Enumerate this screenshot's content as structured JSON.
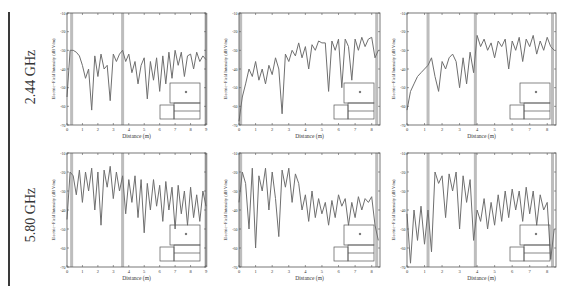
{
  "figure": {
    "rows": [
      {
        "label": "2.44 GHz"
      },
      {
        "label": "5.80 GHz"
      }
    ],
    "colors": {
      "trace": "#6f6f6f",
      "axes": "#555555",
      "marker_band": "#bdbdbd",
      "divider": "#3a3a3a"
    }
  },
  "chart_data": [
    {
      "type": "line",
      "row": "2.44 GHz",
      "col": 1,
      "xlabel": "Distance (m)",
      "ylabel": "Electric−Field Intensity (dB V/m)",
      "xlim": [
        0,
        9
      ],
      "ylim": [
        -70,
        -10
      ],
      "xticks": [
        0,
        1,
        2,
        3,
        4,
        5,
        6,
        7,
        8,
        9
      ],
      "yticks": [
        -10,
        -20,
        -30,
        -40,
        -50,
        -60,
        -70
      ],
      "markers_x": [
        0.3,
        3.6,
        9.0
      ],
      "x": [
        0,
        0.2,
        0.4,
        0.6,
        0.8,
        1.0,
        1.2,
        1.4,
        1.6,
        1.8,
        2.0,
        2.2,
        2.4,
        2.6,
        2.8,
        3.0,
        3.2,
        3.4,
        3.6,
        3.8,
        4.0,
        4.2,
        4.4,
        4.6,
        4.8,
        5.0,
        5.2,
        5.4,
        5.6,
        5.8,
        6.0,
        6.2,
        6.4,
        6.6,
        6.8,
        7.0,
        7.2,
        7.4,
        7.6,
        7.8,
        8.0,
        8.2,
        8.4,
        8.6,
        8.8,
        9.0
      ],
      "y": [
        -55,
        -30,
        -30,
        -31,
        -33,
        -38,
        -45,
        -40,
        -62,
        -33,
        -44,
        -32,
        -40,
        -38,
        -57,
        -32,
        -36,
        -32,
        -30,
        -36,
        -32,
        -42,
        -36,
        -48,
        -38,
        -34,
        -56,
        -36,
        -46,
        -34,
        -52,
        -33,
        -48,
        -31,
        -45,
        -30,
        -38,
        -31,
        -44,
        -33,
        -32,
        -40,
        -31,
        -36,
        -33,
        -35
      ]
    },
    {
      "type": "line",
      "row": "2.44 GHz",
      "col": 2,
      "xlabel": "Distance (m)",
      "ylabel": "Electric−Field Intensity (dB V/m)",
      "xlim": [
        0,
        8.5
      ],
      "ylim": [
        -70,
        -10
      ],
      "xticks": [
        0,
        1,
        2,
        3,
        4,
        5,
        6,
        7,
        8
      ],
      "yticks": [
        -10,
        -20,
        -30,
        -40,
        -50,
        -60,
        -70
      ],
      "markers_x": [
        0.1,
        8.3
      ],
      "x": [
        0,
        0.2,
        0.4,
        0.6,
        0.8,
        1.0,
        1.2,
        1.4,
        1.6,
        1.8,
        2.0,
        2.2,
        2.4,
        2.6,
        2.8,
        3.0,
        3.2,
        3.4,
        3.6,
        3.8,
        4.0,
        4.2,
        4.4,
        4.6,
        4.8,
        5.0,
        5.2,
        5.4,
        5.6,
        5.8,
        6.0,
        6.2,
        6.4,
        6.6,
        6.8,
        7.0,
        7.2,
        7.4,
        7.6,
        7.8,
        8.0,
        8.2,
        8.4
      ],
      "y": [
        -68,
        -55,
        -48,
        -40,
        -44,
        -36,
        -46,
        -40,
        -48,
        -38,
        -43,
        -34,
        -40,
        -64,
        -32,
        -36,
        -30,
        -33,
        -26,
        -34,
        -28,
        -40,
        -27,
        -30,
        -25,
        -26,
        -26,
        -52,
        -25,
        -30,
        -24,
        -50,
        -24,
        -28,
        -46,
        -24,
        -30,
        -23,
        -28,
        -24,
        -23,
        -34,
        -30
      ]
    },
    {
      "type": "line",
      "row": "2.44 GHz",
      "col": 3,
      "xlabel": "Distance (m)",
      "ylabel": "Electric−Field Intensity (dB V/m)",
      "xlim": [
        0,
        8.5
      ],
      "ylim": [
        -70,
        -10
      ],
      "xticks": [
        0,
        1,
        2,
        3,
        4,
        5,
        6,
        7,
        8
      ],
      "yticks": [
        -10,
        -20,
        -30,
        -40,
        -50,
        -60,
        -70
      ],
      "markers_x": [
        1.2,
        3.9,
        8.3
      ],
      "x": [
        0,
        0.2,
        0.4,
        0.6,
        0.8,
        1.0,
        1.2,
        1.4,
        1.6,
        1.8,
        2.0,
        2.2,
        2.4,
        2.6,
        2.8,
        3.0,
        3.2,
        3.4,
        3.6,
        3.8,
        4.0,
        4.2,
        4.4,
        4.6,
        4.8,
        5.0,
        5.2,
        5.4,
        5.6,
        5.8,
        6.0,
        6.2,
        6.4,
        6.6,
        6.8,
        7.0,
        7.2,
        7.4,
        7.6,
        7.8,
        8.0,
        8.2,
        8.4
      ],
      "y": [
        -62,
        -52,
        -48,
        -44,
        -42,
        -40,
        -38,
        -34,
        -44,
        -52,
        -36,
        -40,
        -34,
        -32,
        -36,
        -50,
        -34,
        -48,
        -31,
        -42,
        -22,
        -28,
        -24,
        -30,
        -26,
        -34,
        -25,
        -28,
        -24,
        -40,
        -25,
        -30,
        -23,
        -36,
        -24,
        -28,
        -22,
        -32,
        -25,
        -30,
        -23,
        -28,
        -30
      ]
    },
    {
      "type": "line",
      "row": "5.80 GHz",
      "col": 1,
      "xlabel": "Distance (m)",
      "ylabel": "Electric−Field Intensity (dB V/m)",
      "xlim": [
        0,
        9
      ],
      "ylim": [
        -70,
        -10
      ],
      "xticks": [
        0,
        1,
        2,
        3,
        4,
        5,
        6,
        7,
        8,
        9
      ],
      "yticks": [
        -10,
        -20,
        -30,
        -40,
        -50,
        -60,
        -70
      ],
      "markers_x": [
        0.3,
        3.6,
        9.0
      ],
      "x": [
        0,
        0.2,
        0.4,
        0.6,
        0.8,
        1.0,
        1.2,
        1.4,
        1.6,
        1.8,
        2.0,
        2.2,
        2.4,
        2.6,
        2.8,
        3.0,
        3.2,
        3.4,
        3.6,
        3.8,
        4.0,
        4.2,
        4.4,
        4.6,
        4.8,
        5.0,
        5.2,
        5.4,
        5.6,
        5.8,
        6.0,
        6.2,
        6.4,
        6.6,
        6.8,
        7.0,
        7.2,
        7.4,
        7.6,
        7.8,
        8.0,
        8.2,
        8.4,
        8.6,
        8.8,
        9.0
      ],
      "y": [
        -45,
        -20,
        -22,
        -32,
        -19,
        -36,
        -20,
        -30,
        -18,
        -40,
        -20,
        -48,
        -19,
        -28,
        -17,
        -34,
        -20,
        -30,
        -22,
        -42,
        -24,
        -36,
        -22,
        -44,
        -24,
        -52,
        -26,
        -40,
        -24,
        -38,
        -27,
        -46,
        -25,
        -40,
        -28,
        -50,
        -27,
        -42,
        -30,
        -48,
        -28,
        -44,
        -32,
        -46,
        -30,
        -38
      ]
    },
    {
      "type": "line",
      "row": "5.80 GHz",
      "col": 2,
      "xlabel": "Distance (m)",
      "ylabel": "Electric−Field Intensity (dB V/m)",
      "xlim": [
        0,
        8.5
      ],
      "ylim": [
        -70,
        -10
      ],
      "xticks": [
        0,
        1,
        2,
        3,
        4,
        5,
        6,
        7,
        8
      ],
      "yticks": [
        -10,
        -20,
        -30,
        -40,
        -50,
        -60,
        -70
      ],
      "markers_x": [
        0.1,
        8.3
      ],
      "x": [
        0,
        0.2,
        0.4,
        0.6,
        0.8,
        1.0,
        1.2,
        1.4,
        1.6,
        1.8,
        2.0,
        2.2,
        2.4,
        2.6,
        2.8,
        3.0,
        3.2,
        3.4,
        3.6,
        3.8,
        4.0,
        4.2,
        4.4,
        4.6,
        4.8,
        5.0,
        5.2,
        5.4,
        5.6,
        5.8,
        6.0,
        6.2,
        6.4,
        6.6,
        6.8,
        7.0,
        7.2,
        7.4,
        7.6,
        7.8,
        8.0,
        8.2,
        8.4
      ],
      "y": [
        -36,
        -20,
        -26,
        -50,
        -18,
        -60,
        -22,
        -30,
        -18,
        -40,
        -20,
        -34,
        -54,
        -19,
        -28,
        -18,
        -36,
        -21,
        -26,
        -40,
        -32,
        -46,
        -30,
        -44,
        -34,
        -42,
        -36,
        -48,
        -35,
        -44,
        -32,
        -38,
        -34,
        -48,
        -36,
        -44,
        -33,
        -40,
        -34,
        -36,
        -33,
        -48,
        -56
      ]
    },
    {
      "type": "line",
      "row": "5.80 GHz",
      "col": 3,
      "xlabel": "Distance (m)",
      "ylabel": "Electric−Field Intensity (dB V/m)",
      "xlim": [
        0,
        8.5
      ],
      "ylim": [
        -70,
        -10
      ],
      "xticks": [
        0,
        1,
        2,
        3,
        4,
        5,
        6,
        7,
        8
      ],
      "yticks": [
        -10,
        -20,
        -30,
        -40,
        -50,
        -60,
        -70
      ],
      "markers_x": [
        1.2,
        3.9,
        8.3
      ],
      "x": [
        0,
        0.2,
        0.4,
        0.6,
        0.8,
        1.0,
        1.2,
        1.4,
        1.6,
        1.8,
        2.0,
        2.2,
        2.4,
        2.6,
        2.8,
        3.0,
        3.2,
        3.4,
        3.6,
        3.8,
        4.0,
        4.2,
        4.4,
        4.6,
        4.8,
        5.0,
        5.2,
        5.4,
        5.6,
        5.8,
        6.0,
        6.2,
        6.4,
        6.6,
        6.8,
        7.0,
        7.2,
        7.4,
        7.6,
        7.8,
        8.0,
        8.2,
        8.4
      ],
      "y": [
        -42,
        -68,
        -40,
        -56,
        -38,
        -58,
        -40,
        -62,
        -20,
        -26,
        -22,
        -44,
        -21,
        -30,
        -20,
        -50,
        -22,
        -36,
        -24,
        -56,
        -40,
        -46,
        -34,
        -50,
        -36,
        -48,
        -32,
        -46,
        -30,
        -44,
        -29,
        -40,
        -30,
        -46,
        -28,
        -42,
        -30,
        -48,
        -32,
        -40,
        -36,
        -66,
        -50
      ]
    }
  ]
}
